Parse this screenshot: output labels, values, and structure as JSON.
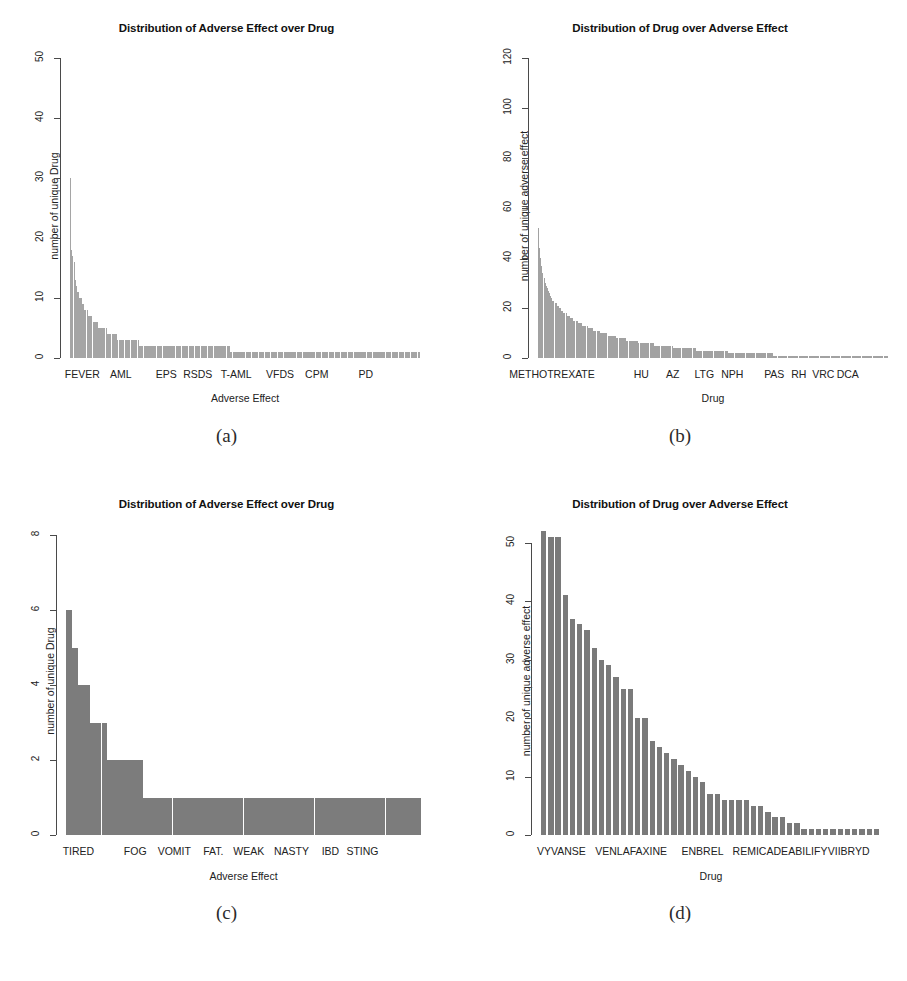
{
  "figure": {
    "caption_a": "(a)",
    "caption_b": "(b)",
    "caption_c": "(c)",
    "caption_d": "(d)",
    "bar_color": "#9a9a9a",
    "bar_color_dark": "#6f6f6f",
    "axis_color": "#4a4a4a"
  },
  "chart_data": [
    {
      "panel": "a",
      "type": "bar",
      "title": "Distribution of Adverse Effect over Drug",
      "xlabel": "Adverse Effect",
      "ylabel": "number of unique Drug",
      "ylim": [
        0,
        50
      ],
      "yticks": [
        0,
        10,
        20,
        30,
        40,
        50
      ],
      "ytick_labels": [
        "0",
        "10",
        "20",
        "30",
        "40",
        "50"
      ],
      "grid": false,
      "legend": "none",
      "xtick_labels": [
        "FEVER",
        "AML",
        "EPS",
        "RSDS",
        "T-AML",
        "VFDS",
        "CPM",
        "PD"
      ],
      "xtick_positions": [
        0.035,
        0.145,
        0.275,
        0.365,
        0.475,
        0.6,
        0.705,
        0.845
      ],
      "n_categories": 300,
      "description": "Long-tailed rank-frequency distribution of number of unique drugs per adverse effect; maximum 30, decaying to a long tail of 1.",
      "values": [
        30,
        18,
        17,
        16,
        13,
        12,
        11,
        11,
        10,
        10,
        9,
        9,
        8,
        8,
        8,
        7,
        7,
        7,
        7,
        6,
        6,
        6,
        6,
        6,
        5,
        5,
        5,
        5,
        5,
        5,
        5,
        4,
        4,
        4,
        4,
        4,
        4,
        4,
        4,
        4,
        3,
        3,
        3,
        3,
        3,
        3,
        3,
        3,
        3,
        3,
        3,
        3,
        3,
        3,
        3,
        3,
        3,
        3,
        2,
        2,
        2,
        2,
        2,
        2,
        2,
        2,
        2,
        2,
        2,
        2,
        2,
        2,
        2,
        2,
        2,
        2,
        2,
        2,
        2,
        2,
        2,
        2,
        2,
        2,
        2,
        2,
        2,
        2,
        2,
        2,
        2,
        2,
        2,
        2,
        2,
        2,
        2,
        2,
        2,
        2,
        2,
        2,
        2,
        2,
        2,
        2,
        2,
        2,
        2,
        2,
        2,
        2,
        2,
        2,
        2,
        2,
        2,
        2,
        2,
        2,
        2,
        2,
        2,
        2,
        2,
        2,
        2,
        2,
        2,
        2,
        2,
        2,
        2,
        2,
        2,
        1,
        1,
        1,
        1,
        1,
        1,
        1,
        1,
        1,
        1,
        1,
        1,
        1,
        1,
        1,
        1,
        1,
        1,
        1,
        1,
        1,
        1,
        1,
        1,
        1,
        1,
        1,
        1,
        1,
        1,
        1,
        1,
        1,
        1,
        1,
        1,
        1,
        1,
        1,
        1,
        1,
        1,
        1,
        1,
        1,
        1,
        1,
        1,
        1,
        1,
        1,
        1,
        1,
        1,
        1,
        1,
        1,
        1,
        1,
        1,
        1,
        1,
        1,
        1,
        1,
        1,
        1,
        1,
        1,
        1,
        1,
        1,
        1,
        1,
        1,
        1,
        1,
        1,
        1,
        1,
        1,
        1,
        1,
        1,
        1,
        1,
        1,
        1,
        1,
        1,
        1,
        1,
        1,
        1,
        1,
        1,
        1,
        1,
        1,
        1,
        1,
        1,
        1,
        1,
        1,
        1,
        1,
        1,
        1,
        1,
        1,
        1,
        1,
        1,
        1,
        1,
        1,
        1,
        1,
        1,
        1,
        1,
        1,
        1,
        1,
        1,
        1,
        1,
        1,
        1,
        1,
        1,
        1,
        1,
        1,
        1,
        1,
        1,
        1,
        1,
        1,
        1,
        1,
        1,
        1,
        1,
        1,
        1,
        1,
        1,
        1,
        1,
        1,
        1,
        1,
        1,
        1,
        1,
        1,
        1
      ]
    },
    {
      "panel": "b",
      "type": "bar",
      "title": "Distribution of Drug over Adverse Effect",
      "xlabel": "Drug",
      "ylabel": "number of unique adverse effect",
      "ylim": [
        0,
        120
      ],
      "yticks": [
        0,
        20,
        40,
        60,
        80,
        100,
        120
      ],
      "ytick_labels": [
        "0",
        "20",
        "40",
        "60",
        "80",
        "100",
        "120"
      ],
      "grid": false,
      "legend": "none",
      "xtick_labels": [
        "METHOTREXATE",
        "HU",
        "AZ",
        "LTG",
        "NPH",
        "PAS",
        "RH",
        "VRC",
        "DCA"
      ],
      "xtick_positions": [
        0.04,
        0.295,
        0.385,
        0.475,
        0.555,
        0.675,
        0.745,
        0.815,
        0.885
      ],
      "n_categories": 320,
      "description": "Long-tailed rank-frequency distribution of number of unique adverse effects per drug; maximum 52, decaying to a long tail of 1.",
      "values": [
        52,
        44,
        40,
        37,
        34,
        32,
        30,
        29,
        28,
        27,
        26,
        25,
        24,
        23,
        23,
        22,
        22,
        21,
        21,
        20,
        20,
        19,
        19,
        18,
        18,
        18,
        17,
        17,
        17,
        16,
        16,
        16,
        15,
        15,
        15,
        15,
        14,
        14,
        14,
        14,
        13,
        13,
        13,
        13,
        13,
        12,
        12,
        12,
        12,
        12,
        11,
        11,
        11,
        11,
        11,
        11,
        10,
        10,
        10,
        10,
        10,
        10,
        10,
        9,
        9,
        9,
        9,
        9,
        9,
        9,
        9,
        8,
        8,
        8,
        8,
        8,
        8,
        8,
        8,
        8,
        7,
        7,
        7,
        7,
        7,
        7,
        7,
        7,
        7,
        7,
        7,
        6,
        6,
        6,
        6,
        6,
        6,
        6,
        6,
        6,
        6,
        6,
        6,
        6,
        6,
        5,
        5,
        5,
        5,
        5,
        5,
        5,
        5,
        5,
        5,
        5,
        5,
        5,
        5,
        5,
        5,
        5,
        4,
        4,
        4,
        4,
        4,
        4,
        4,
        4,
        4,
        4,
        4,
        4,
        4,
        4,
        4,
        4,
        4,
        4,
        4,
        4,
        4,
        3,
        3,
        3,
        3,
        3,
        3,
        3,
        3,
        3,
        3,
        3,
        3,
        3,
        3,
        3,
        3,
        3,
        3,
        3,
        3,
        3,
        3,
        3,
        3,
        3,
        3,
        3,
        3,
        3,
        2,
        2,
        2,
        2,
        2,
        2,
        2,
        2,
        2,
        2,
        2,
        2,
        2,
        2,
        2,
        2,
        2,
        2,
        2,
        2,
        2,
        2,
        2,
        2,
        2,
        2,
        2,
        2,
        2,
        2,
        2,
        2,
        2,
        2,
        2,
        2,
        2,
        2,
        2,
        2,
        2,
        1,
        1,
        1,
        1,
        1,
        1,
        1,
        1,
        1,
        1,
        1,
        1,
        1,
        1,
        1,
        1,
        1,
        1,
        1,
        1,
        1,
        1,
        1,
        1,
        1,
        1,
        1,
        1,
        1,
        1,
        1,
        1,
        1,
        1,
        1,
        1,
        1,
        1,
        1,
        1,
        1,
        1,
        1,
        1,
        1,
        1,
        1,
        1,
        1,
        1,
        1,
        1,
        1,
        1,
        1,
        1,
        1,
        1,
        1,
        1,
        1,
        1,
        1,
        1,
        1,
        1,
        1,
        1,
        1,
        1,
        1,
        1,
        1,
        1,
        1,
        1,
        1,
        1,
        1,
        1,
        1,
        1,
        1,
        1,
        1,
        1,
        1,
        1,
        1,
        1,
        1,
        1,
        1,
        1,
        1,
        1,
        1,
        1,
        1,
        1,
        1,
        1,
        1,
        1
      ]
    },
    {
      "panel": "c",
      "type": "bar",
      "title": "Distribution of Adverse Effect over Drug",
      "xlabel": "Adverse Effect",
      "ylabel": "number of unique Drug",
      "ylim": [
        0,
        8
      ],
      "yticks": [
        0,
        2,
        4,
        6,
        8
      ],
      "ytick_labels": [
        "0",
        "2",
        "4",
        "6",
        "8"
      ],
      "grid": false,
      "legend": "none",
      "xtick_labels": [
        "TIRED",
        "FOG",
        "VOMIT",
        "FAT.",
        "WEAK",
        "NASTY",
        "IBD",
        "STING"
      ],
      "xtick_positions": [
        0.035,
        0.195,
        0.305,
        0.415,
        0.515,
        0.635,
        0.745,
        0.835
      ],
      "n_categories": 60,
      "description": "Step-wise rank-frequency distribution; first bar 6, then 5, 4, 3, then a run at 2, then a long plateau at 1.",
      "values": [
        6,
        5,
        4,
        4,
        3,
        3,
        3,
        2,
        2,
        2,
        2,
        2,
        2,
        1,
        1,
        1,
        1,
        1,
        1,
        1,
        1,
        1,
        1,
        1,
        1,
        1,
        1,
        1,
        1,
        1,
        1,
        1,
        1,
        1,
        1,
        1,
        1,
        1,
        1,
        1,
        1,
        1,
        1,
        1,
        1,
        1,
        1,
        1,
        1,
        1,
        1,
        1,
        1,
        1,
        1,
        1,
        1,
        1,
        1,
        1
      ]
    },
    {
      "panel": "d",
      "type": "bar",
      "title": "Distribution of Drug over Adverse Effect",
      "xlabel": "Drug",
      "ylabel": "number of unique adverse effect",
      "ylim": [
        0,
        53
      ],
      "yticks": [
        0,
        10,
        20,
        30,
        40,
        50
      ],
      "ytick_labels": [
        "0",
        "10",
        "20",
        "30",
        "40",
        "50"
      ],
      "grid": false,
      "legend": "none",
      "xtick_labels": [
        "VYVANSE",
        "VENLAFAXINE",
        "ENBREL",
        "REMICADE",
        "ABILIFY",
        "VIIBRYD"
      ],
      "xtick_positions": [
        0.06,
        0.265,
        0.475,
        0.645,
        0.785,
        0.905
      ],
      "n_categories": 47,
      "description": "Discrete rank-frequency bars of unique adverse effects per drug, from 52 down to a tail of 1.",
      "values": [
        52,
        51,
        51,
        41,
        37,
        36,
        35,
        32,
        30,
        29,
        27,
        25,
        25,
        20,
        20,
        16,
        15,
        14,
        13,
        12,
        11,
        10,
        9,
        7,
        7,
        6,
        6,
        6,
        6,
        5,
        5,
        4,
        3,
        3,
        2,
        2,
        1,
        1,
        1,
        1,
        1,
        1,
        1,
        1,
        1,
        1,
        1
      ]
    }
  ]
}
